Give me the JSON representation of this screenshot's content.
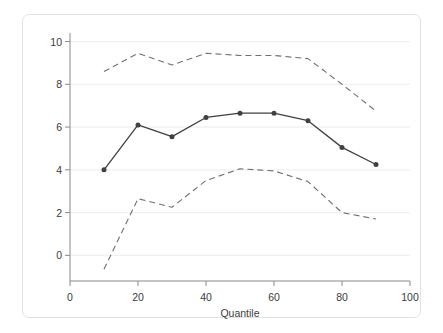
{
  "chart_data": {
    "type": "line",
    "title": "",
    "subtitle": "",
    "xlabel": "Quantile",
    "ylabel": "",
    "xlim": [
      0,
      100
    ],
    "ylim": [
      -1.2,
      10.4
    ],
    "xticks": [
      0,
      20,
      40,
      60,
      80,
      100
    ],
    "yticks": [
      0,
      2,
      4,
      6,
      8,
      10
    ],
    "xtick_labels": [
      "0",
      "20",
      "40",
      "60",
      "80",
      "100"
    ],
    "ytick_labels": [
      "0",
      "2",
      "4",
      "6",
      "8",
      "10"
    ],
    "grid": "horizontal",
    "legend": "none",
    "x": [
      10,
      20,
      30,
      40,
      50,
      60,
      70,
      80,
      90
    ],
    "series": [
      {
        "name": "Quantile regression estimate",
        "style": "solid-with-markers",
        "color": "#404040",
        "marker": "filled-circle",
        "values": [
          4.0,
          6.1,
          5.55,
          6.45,
          6.65,
          6.65,
          6.3,
          5.05,
          4.25
        ]
      },
      {
        "name": "Upper 95% confidence bound",
        "style": "dashed",
        "color": "#6f6f78",
        "marker": "none",
        "values": [
          8.6,
          9.45,
          8.9,
          9.45,
          9.35,
          9.35,
          9.2,
          8.0,
          6.75
        ]
      },
      {
        "name": "Lower 95% confidence bound",
        "style": "dashed",
        "color": "#6f6f78",
        "marker": "none",
        "values": [
          -0.65,
          2.65,
          2.25,
          3.5,
          4.05,
          3.95,
          3.45,
          2.0,
          1.7
        ]
      }
    ],
    "colors": {
      "background": "#ffffff",
      "frame_border": "#e2e2e4",
      "axis_line": "#8a8a8a",
      "grid_line": "#f0f0f2",
      "tick_text": "#3b3b3b",
      "estimate_line": "#404040",
      "band_line": "#6f6f78"
    }
  }
}
